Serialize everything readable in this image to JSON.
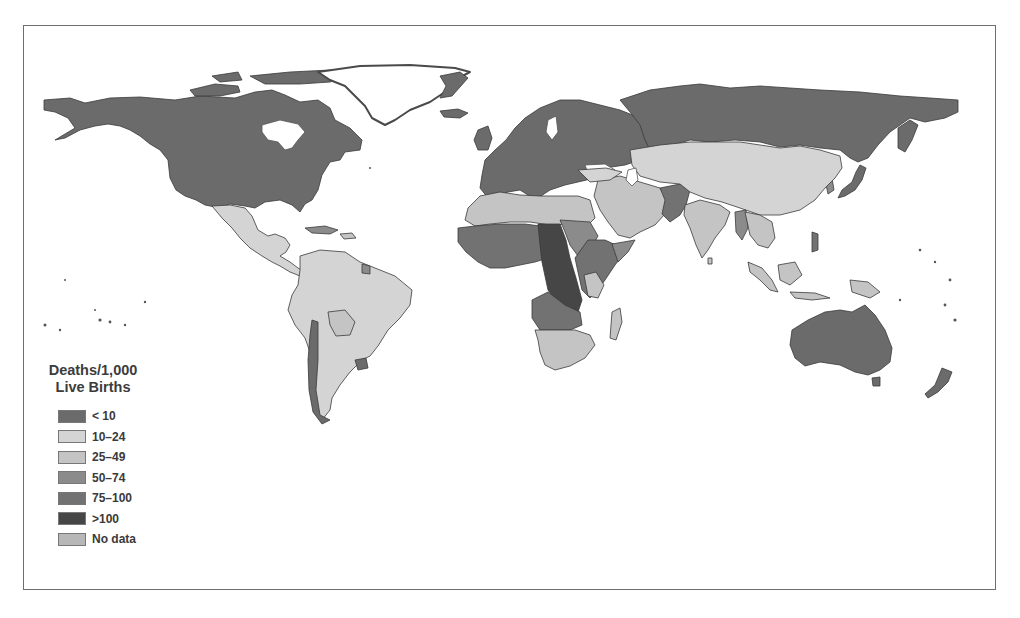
{
  "map": {
    "type": "choropleth",
    "subject": "Infant mortality by country",
    "projection": "equirectangular world map",
    "legend": {
      "title_line1": "Deaths/1,000",
      "title_line2": "Live Births",
      "items": [
        {
          "label": "< 10",
          "color": "#6b6b6b"
        },
        {
          "label": "10–24",
          "color": "#d4d4d4"
        },
        {
          "label": "25–49",
          "color": "#c4c4c4"
        },
        {
          "label": "50–74",
          "color": "#8b8b8b"
        },
        {
          "label": "75–100",
          "color": "#727272"
        },
        {
          "label": ">100",
          "color": "#464646"
        },
        {
          "label": "No data",
          "color": "#b7b7b7"
        }
      ]
    },
    "regions": [
      {
        "name": "North America (USA, Canada)",
        "class": "< 10"
      },
      {
        "name": "Mexico / Central America",
        "class": "10–24"
      },
      {
        "name": "South America",
        "class": "10–24"
      },
      {
        "name": "Europe",
        "class": "< 10"
      },
      {
        "name": "Russia",
        "class": "< 10"
      },
      {
        "name": "North Africa",
        "class": "25–49"
      },
      {
        "name": "Central Africa",
        "class": ">100"
      },
      {
        "name": "West & East Africa",
        "class": "75–100"
      },
      {
        "name": "Southern Africa",
        "class": "25–49"
      },
      {
        "name": "Middle East",
        "class": "25–49"
      },
      {
        "name": "Afghanistan / Pakistan",
        "class": "75–100"
      },
      {
        "name": "China / Central Asia",
        "class": "10–24"
      },
      {
        "name": "India",
        "class": "25–49"
      },
      {
        "name": "Southeast Asia",
        "class": "25–49"
      },
      {
        "name": "Japan / Korea",
        "class": "< 10"
      },
      {
        "name": "Australia / New Zealand",
        "class": "< 10"
      }
    ]
  }
}
